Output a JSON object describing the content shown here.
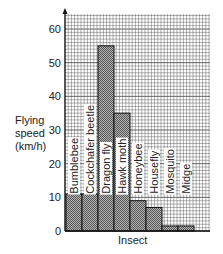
{
  "chart_data": {
    "type": "bar",
    "title": "",
    "xlabel": "Insect",
    "ylabel": "Flying speed (km/h)",
    "ylabel_lines": [
      "Flying",
      "speed",
      "(km/h)"
    ],
    "ylim": [
      0,
      65
    ],
    "yticks": [
      0,
      10,
      20,
      30,
      40,
      50,
      60
    ],
    "grid": true,
    "legend": "none",
    "categories": [
      "Bumblebee",
      "Cockchafer beetle",
      "Dragon fly",
      "Hawk moth",
      "Honeybee",
      "Housefly",
      "Mosquito",
      "Midge"
    ],
    "values": [
      11,
      11,
      55,
      35,
      9,
      7,
      1.5,
      1.5
    ],
    "label_orientation": "vertical-inside-bars"
  },
  "colors": {
    "grid": "#555555",
    "bar_fill": "#8a8a8a",
    "bar_border": "#111111",
    "text": "#222222"
  }
}
